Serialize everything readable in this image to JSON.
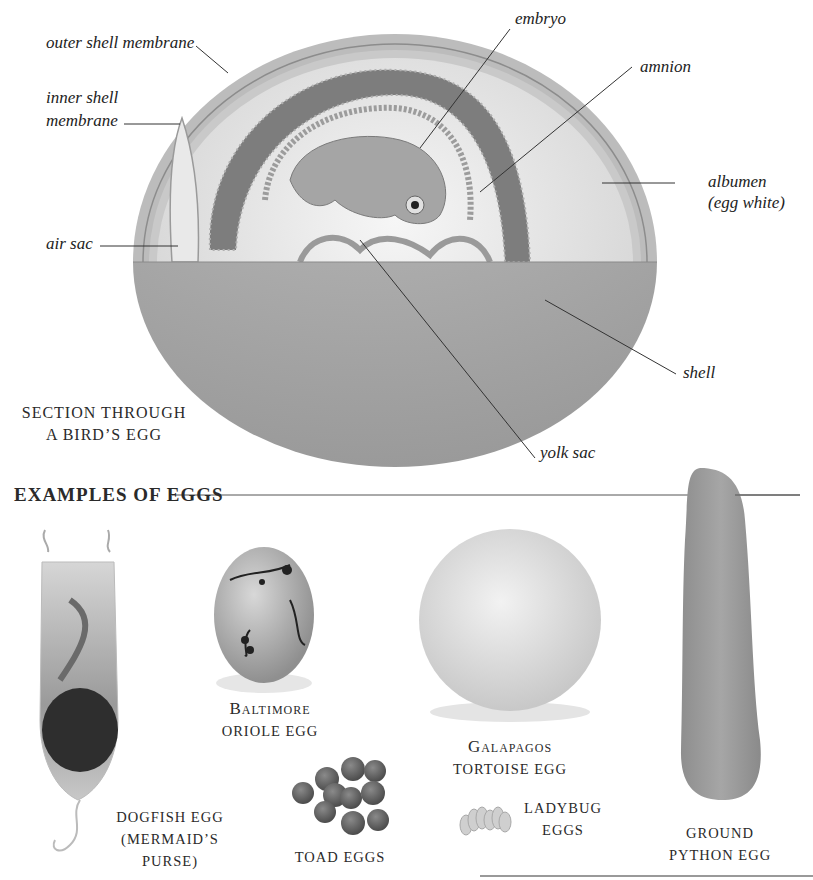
{
  "diagram": {
    "title_lines": [
      "SECTION THROUGH",
      "A BIRD’S EGG"
    ],
    "labels": {
      "outer_shell_membrane": "outer shell membrane",
      "inner_shell_membrane_1": "inner shell",
      "inner_shell_membrane_2": "membrane",
      "air_sac": "air sac",
      "embryo": "embryo",
      "amnion": "amnion",
      "albumen_1": "albumen",
      "albumen_2": "(egg white)",
      "shell": "shell",
      "yolk_sac": "yolk sac"
    }
  },
  "examples": {
    "heading": "EXAMPLES OF EGGS",
    "items": [
      {
        "id": "dogfish",
        "lines": [
          "DOGFISH EGG",
          "(MERMAID’S",
          "PURSE)"
        ]
      },
      {
        "id": "baltimore-oriole",
        "lines": [
          "Baltimore",
          "ORIOLE EGG"
        ]
      },
      {
        "id": "galapagos-tortoise",
        "lines": [
          "Galapagos",
          "TORTOISE EGG"
        ]
      },
      {
        "id": "toad",
        "lines": [
          "TOAD EGGS"
        ]
      },
      {
        "id": "ladybug",
        "lines": [
          "LADYBUG",
          "EGGS"
        ]
      },
      {
        "id": "ground-python",
        "lines": [
          "GROUND",
          "PYTHON EGG"
        ]
      }
    ]
  },
  "colors": {
    "shell": "#a9a9a9",
    "membrane": "#c4c4c4",
    "albumen": "#eaeaea",
    "amnion": "#7d7d7d",
    "text": "#222222"
  }
}
